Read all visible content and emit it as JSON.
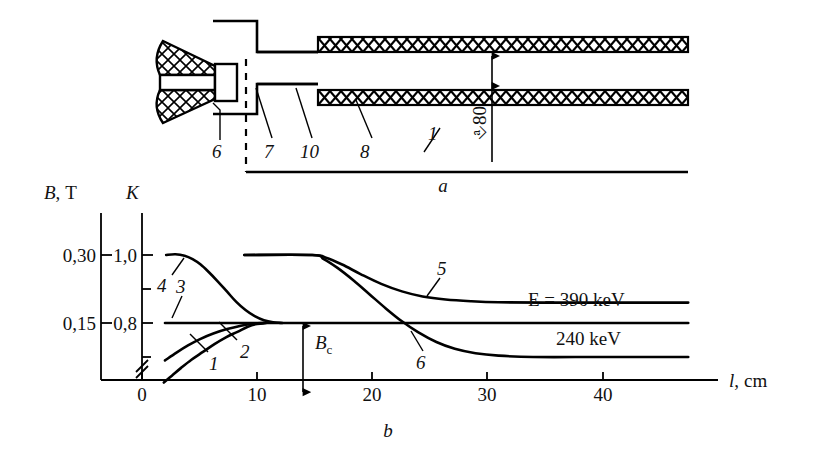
{
  "figure": {
    "panels": [
      {
        "id": "a",
        "caption": "a",
        "kind": "schematic"
      },
      {
        "id": "b",
        "caption": "b",
        "kind": "chart"
      }
    ]
  },
  "schematic": {
    "caption": "a",
    "callouts": [
      {
        "label": "6",
        "x": 218,
        "y": 155
      },
      {
        "label": "7",
        "x": 272,
        "y": 155
      },
      {
        "label": "10",
        "x": 310,
        "y": 155
      },
      {
        "label": "8",
        "x": 367,
        "y": 155
      },
      {
        "label": "1",
        "x": 434,
        "y": 140
      }
    ],
    "dimension": {
      "label": "⎀80",
      "x": 492,
      "y": 118,
      "rotation": -90
    },
    "parts": {
      "source_name": "hatched-funnel-source",
      "coil_name": "cross-hatched-coil-band",
      "beam_axis_name": "beam-axis"
    }
  },
  "chart_data": {
    "type": "line",
    "title": "",
    "caption": "b",
    "xlabel": "l, cm",
    "xlabel_parts": {
      "symbol": "l",
      "separator": ",",
      "unit": "cm"
    },
    "ylabel_left": "B, T",
    "ylabel_left_parts": {
      "symbol": "B",
      "separator": ",",
      "unit": "T"
    },
    "ylabel_right": "K",
    "xlim": [
      -2,
      50
    ],
    "xticks": [
      0,
      10,
      20,
      30,
      40
    ],
    "xticklabels": [
      "0",
      "10",
      "20",
      "30",
      "40"
    ],
    "yticks_left": [
      0.15,
      0.3
    ],
    "yticklabels_left": [
      "0,15",
      "0,30"
    ],
    "yticks_right": [
      0.8,
      1.0
    ],
    "yticklabels_right": [
      "0,8",
      "1,0"
    ],
    "yticks_right_minor": [
      0.7,
      0.9
    ],
    "axis_break_right": true,
    "grid": false,
    "legend_position": "inline-annotations",
    "annotations": [
      {
        "text": "Bₑ",
        "text_parts": {
          "base": "B",
          "sub": "c"
        },
        "name": "bc-arrow-label",
        "x": 16.5,
        "y": 0.735
      },
      {
        "text": "E = 390 keV",
        "name": "energy-390-label",
        "x": 34.0,
        "y": 0.9
      },
      {
        "text": "240 keV",
        "name": "energy-240-label",
        "x": 36.0,
        "y": 0.755
      }
    ],
    "curve_labels": [
      {
        "label": "1",
        "x": 6.4,
        "y": 0.655
      },
      {
        "label": "2",
        "x": 8.6,
        "y": 0.7
      },
      {
        "label": "3",
        "x": 4.3,
        "y": 0.855
      },
      {
        "label": "4",
        "x": 2.2,
        "y": 0.88
      },
      {
        "label": "5",
        "x": 26.5,
        "y": 0.945
      },
      {
        "label": "6",
        "x": 24.8,
        "y": 0.66
      }
    ],
    "series": [
      {
        "name": "1",
        "points": [
          [
            1.9,
            0.625
          ],
          [
            2.6,
            0.645
          ],
          [
            3.4,
            0.668
          ],
          [
            4.3,
            0.692
          ],
          [
            5.3,
            0.715
          ],
          [
            6.3,
            0.738
          ],
          [
            7.3,
            0.758
          ],
          [
            8.3,
            0.774
          ],
          [
            9.2,
            0.789
          ],
          [
            10.0,
            0.797
          ],
          [
            10.8,
            0.8
          ]
        ]
      },
      {
        "name": "2",
        "points": [
          [
            2.0,
            0.69
          ],
          [
            3.0,
            0.713
          ],
          [
            4.0,
            0.734
          ],
          [
            5.0,
            0.752
          ],
          [
            6.2,
            0.769
          ],
          [
            7.4,
            0.782
          ],
          [
            8.6,
            0.792
          ],
          [
            9.6,
            0.798
          ],
          [
            10.6,
            0.8
          ]
        ]
      },
      {
        "name": "3",
        "points": [
          [
            2.0,
            0.8
          ],
          [
            8.0,
            0.8
          ],
          [
            14.0,
            0.8
          ],
          [
            22.0,
            0.8
          ],
          [
            30.0,
            0.8
          ],
          [
            40.0,
            0.8
          ],
          [
            47.5,
            0.8
          ]
        ]
      },
      {
        "name": "4",
        "points": [
          [
            2.1,
            1.0
          ],
          [
            2.9,
            1.002
          ],
          [
            3.7,
            0.998
          ],
          [
            4.4,
            0.988
          ],
          [
            5.1,
            0.972
          ],
          [
            5.8,
            0.95
          ],
          [
            6.6,
            0.922
          ],
          [
            7.4,
            0.892
          ],
          [
            8.2,
            0.862
          ],
          [
            9.0,
            0.838
          ],
          [
            9.8,
            0.82
          ],
          [
            10.6,
            0.808
          ],
          [
            11.4,
            0.802
          ],
          [
            12.2,
            0.8
          ]
        ]
      },
      {
        "name": "5",
        "points": [
          [
            8.9,
            1.0
          ],
          [
            14.8,
            1.0
          ],
          [
            16.0,
            0.992
          ],
          [
            17.4,
            0.972
          ],
          [
            19.0,
            0.944
          ],
          [
            20.8,
            0.915
          ],
          [
            22.6,
            0.893
          ],
          [
            24.4,
            0.878
          ],
          [
            26.4,
            0.869
          ],
          [
            28.6,
            0.864
          ],
          [
            31.0,
            0.861
          ],
          [
            35.0,
            0.86
          ],
          [
            40.0,
            0.86
          ],
          [
            47.5,
            0.86
          ]
        ]
      },
      {
        "name": "6",
        "points": [
          [
            8.9,
            1.0
          ],
          [
            14.8,
            1.0
          ],
          [
            15.8,
            0.988
          ],
          [
            17.0,
            0.962
          ],
          [
            18.4,
            0.925
          ],
          [
            19.8,
            0.884
          ],
          [
            21.2,
            0.843
          ],
          [
            22.6,
            0.805
          ],
          [
            24.0,
            0.773
          ],
          [
            25.6,
            0.744
          ],
          [
            27.2,
            0.724
          ],
          [
            29.0,
            0.711
          ],
          [
            31.0,
            0.704
          ],
          [
            34.0,
            0.7
          ],
          [
            40.0,
            0.7
          ],
          [
            47.5,
            0.7
          ]
        ]
      }
    ],
    "bc_arrow": {
      "x": 14.0,
      "y_top": 0.8,
      "y_bottom": 0.5967
    }
  }
}
